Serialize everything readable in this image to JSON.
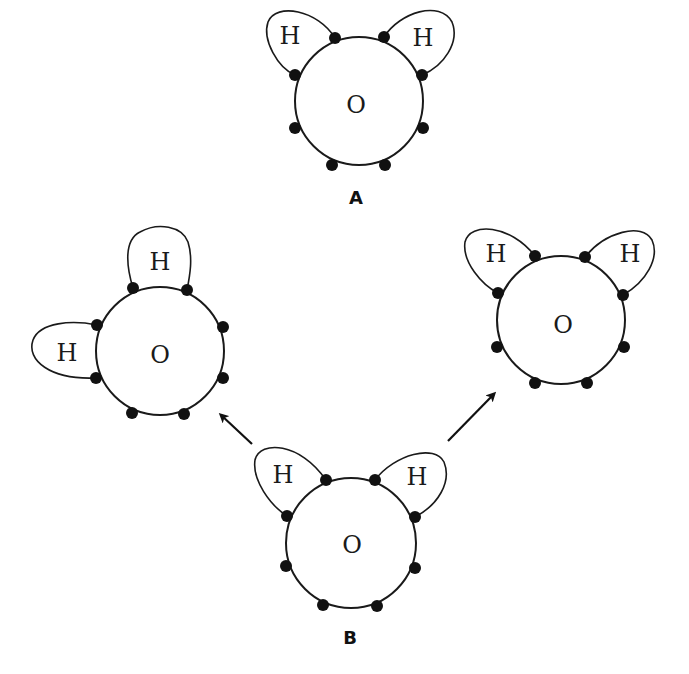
{
  "diagram": {
    "colors": {
      "stroke": "#1a1a1a",
      "electron": "#111111",
      "background": "#ffffff"
    },
    "molecules": [
      {
        "id": "A",
        "label": "A",
        "center_atom": "O",
        "bonded_atoms": [
          "H",
          "H"
        ],
        "arrangement": "H atoms at upper-left and upper-right",
        "electron_count": 8
      },
      {
        "id": "left-product",
        "label": "",
        "center_atom": "O",
        "bonded_atoms": [
          "H",
          "H"
        ],
        "arrangement": "H atoms at top and left",
        "electron_count": 8
      },
      {
        "id": "right-product",
        "label": "",
        "center_atom": "O",
        "bonded_atoms": [
          "H",
          "H"
        ],
        "arrangement": "H atoms at upper-left and upper-right",
        "electron_count": 8
      },
      {
        "id": "B",
        "label": "B",
        "center_atom": "O",
        "bonded_atoms": [
          "H",
          "H"
        ],
        "arrangement": "H atoms at upper-left and upper-right",
        "electron_count": 8
      }
    ],
    "arrows": [
      {
        "from": "B",
        "to": "left-product",
        "direction": "up-left"
      },
      {
        "from": "B",
        "to": "right-product",
        "direction": "up-right"
      }
    ],
    "text": {
      "oxygen": "O",
      "hydrogen": "H",
      "label_a": "A",
      "label_b": "B"
    }
  }
}
